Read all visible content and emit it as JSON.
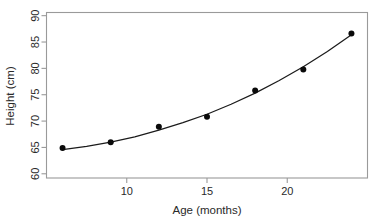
{
  "chart_data": {
    "type": "scatter",
    "title": "",
    "subtitle": "",
    "xlabel": "Age (months)",
    "ylabel": "Height (cm)",
    "x": [
      6,
      9,
      12,
      15,
      18,
      21,
      24
    ],
    "y": [
      64.9,
      66.0,
      68.9,
      70.8,
      75.8,
      79.8,
      86.6
    ],
    "series": [
      {
        "name": "observed",
        "type": "scatter",
        "x": [
          6,
          9,
          12,
          15,
          18,
          21,
          24
        ],
        "values": [
          64.9,
          66.0,
          68.9,
          70.8,
          75.8,
          79.8,
          86.6
        ],
        "marker": "filled-circle",
        "color": "#0a0a0a"
      },
      {
        "name": "fitted-curve",
        "type": "line",
        "x": [
          6,
          7.5,
          9,
          10.5,
          12,
          13.5,
          15,
          16.5,
          18,
          19.5,
          21,
          22.5,
          24
        ],
        "values": [
          64.6,
          65.2,
          66.0,
          67.0,
          68.3,
          69.7,
          71.3,
          73.2,
          75.3,
          77.7,
          80.3,
          83.2,
          86.4
        ],
        "color": "#1b1b1b"
      }
    ],
    "xlim": [
      5,
      25
    ],
    "ylim": [
      59.2,
      90.6
    ],
    "xticks": [
      10,
      15,
      20
    ],
    "yticks": [
      60,
      65,
      70,
      75,
      80,
      85,
      90
    ],
    "xticklabels": [
      "10",
      "15",
      "20"
    ],
    "yticklabels": [
      "60",
      "65",
      "70",
      "75",
      "80",
      "85",
      "90"
    ],
    "grid": false,
    "legend": false,
    "legend_position": "none",
    "frame": true,
    "frame_color": "#9a9a9a",
    "background": "#ffffff",
    "ylabel_rotation": 90,
    "ytick_label_rotation": 90
  },
  "axes": {
    "x_title": "Age (months)",
    "y_title": "Height (cm)",
    "x_tick_labels": [
      "10",
      "15",
      "20"
    ],
    "y_tick_labels": [
      "60",
      "65",
      "70",
      "75",
      "80",
      "85",
      "90"
    ]
  }
}
